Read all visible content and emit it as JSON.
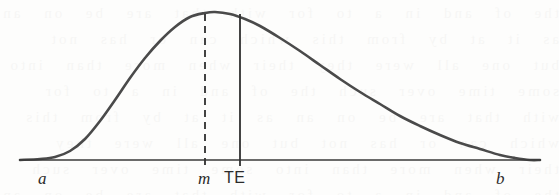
{
  "figure": {
    "kind": "pert-beta-distribution-curve",
    "background_color": "#fdfdfc",
    "curve_color": "#4a4a4a",
    "axis_color": "#3a3a3a",
    "label_color": "#2b2b2b",
    "showthrough_text": "the of and in a to for with that are be on an as it at by from this which can or has not but one all were they their when more than into some time over such"
  },
  "axis": {
    "name": "horizontal-axis",
    "x_start": 20,
    "x_end": 540,
    "y": 160
  },
  "labels": {
    "a": {
      "text": "a",
      "style": "italic-serif",
      "x": 38,
      "y": 170
    },
    "m": {
      "text": "m",
      "style": "italic-serif",
      "x": 198,
      "y": 170
    },
    "te": {
      "text": "TE",
      "style": "upright-sans",
      "x": 224,
      "y": 170
    },
    "b": {
      "text": "b",
      "style": "italic-serif",
      "x": 496,
      "y": 170
    }
  },
  "markers": [
    {
      "name": "mode-marker",
      "label": "m",
      "line_style": "dashed",
      "x": 205,
      "y_top": 14,
      "y_bottom": 166,
      "dash_pattern": "7,5"
    },
    {
      "name": "expected-time-marker",
      "label": "TE",
      "line_style": "solid",
      "x": 240,
      "y_top": 14,
      "y_bottom": 166
    }
  ],
  "chart_data": {
    "type": "line",
    "title": "",
    "subtitle": "",
    "xlabel": "",
    "ylabel": "",
    "grid": false,
    "legend": false,
    "legend_position": "none",
    "xlim": [
      20,
      540
    ],
    "ylim": [
      0,
      150
    ],
    "tick_labels": [
      "a",
      "m",
      "TE",
      "b"
    ],
    "annotations": [
      {
        "label": "a",
        "x": 55,
        "note": "optimistic time / lower bound of distribution"
      },
      {
        "label": "m",
        "x": 205,
        "note": "most likely time (mode), dashed vertical line to peak"
      },
      {
        "label": "TE",
        "x": 240,
        "note": "expected time (mean), solid vertical line to curve"
      },
      {
        "label": "b",
        "x": 510,
        "note": "pessimistic time / upper bound of distribution"
      }
    ],
    "series": [
      {
        "name": "probability-density",
        "x": [
          20,
          40,
          55,
          70,
          85,
          100,
          115,
          130,
          145,
          160,
          175,
          190,
          205,
          215,
          230,
          245,
          260,
          280,
          300,
          320,
          340,
          360,
          380,
          400,
          420,
          440,
          460,
          480,
          500,
          515,
          530,
          540
        ],
        "y": [
          0,
          1,
          3,
          9,
          21,
          39,
          60,
          82,
          102,
          119,
          133,
          143,
          147,
          148,
          146,
          141,
          134,
          122,
          109,
          95,
          81,
          68,
          56,
          44,
          34,
          25,
          17,
          11,
          5,
          2,
          0,
          0
        ]
      }
    ]
  }
}
